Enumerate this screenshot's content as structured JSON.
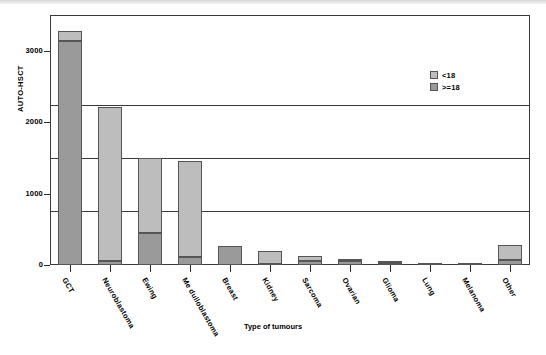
{
  "chart_data": {
    "type": "bar",
    "stacked": true,
    "title": "",
    "xlabel": "Type of tumours",
    "ylabel": "AUTO-HSCT",
    "ylim": [
      0,
      3500
    ],
    "yticks": [
      0,
      1000,
      2000,
      3000
    ],
    "ytick_labels": [
      "0",
      "1000",
      "2000",
      "3000"
    ],
    "grid": true,
    "legend_position": "upper-right",
    "categories": [
      "GCT",
      "Neuroblastoma",
      "Ewing",
      "Me dulloblastoma",
      "Breast",
      "Kidney",
      "Sarcoma",
      "Ovarian",
      "Glioma",
      "Lung",
      "Melanoma",
      "Other"
    ],
    "series": [
      {
        "name": ">=18",
        "color": "#9a9a9a",
        "values": [
          3140,
          60,
          450,
          110,
          260,
          10,
          50,
          60,
          25,
          15,
          5,
          70
        ]
      },
      {
        "name": "<18",
        "color": "#bdbdbd",
        "values": [
          140,
          2150,
          1050,
          1340,
          0,
          180,
          80,
          10,
          30,
          0,
          0,
          210
        ]
      }
    ],
    "totals": [
      3280,
      2210,
      1500,
      1450,
      260,
      190,
      130,
      70,
      55,
      15,
      5,
      280
    ]
  },
  "legend": {
    "items": [
      {
        "label": "<18",
        "color": "#bdbdbd"
      },
      {
        "label": ">=18",
        "color": "#9a9a9a"
      }
    ]
  },
  "axes": {
    "y_title": "AUTO-HSCT",
    "x_title": "Type of tumours"
  }
}
